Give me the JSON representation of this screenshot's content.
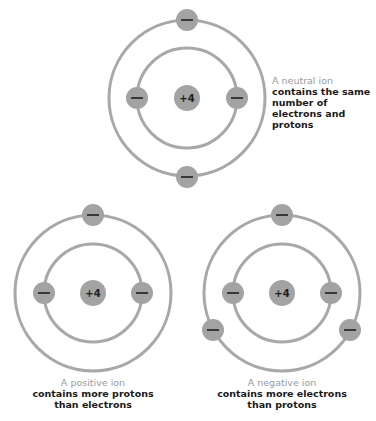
{
  "colors": {
    "orbit": "#a8a8a8",
    "particle_fill": "#a3a3a3",
    "glyph": "#1e1e1e",
    "caption_title": "#9a9a9a",
    "caption_body": "#1a1a1a"
  },
  "atoms": [
    {
      "id": "neutral",
      "nucleus_label": "+4",
      "caption_title": "A neutral ion",
      "caption_body": "contains the same number of electrons and protons",
      "electron_count": 4
    },
    {
      "id": "positive",
      "nucleus_label": "+4",
      "caption_title": "A positive ion",
      "caption_body": "contains more protons than electrons",
      "electron_count": 3
    },
    {
      "id": "negative",
      "nucleus_label": "+4",
      "caption_title": "A negative ion",
      "caption_body": "contains more electrons than protons",
      "electron_count": 5
    }
  ],
  "electron_symbol": "—"
}
